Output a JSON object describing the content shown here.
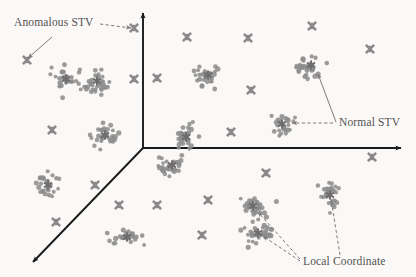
{
  "figure": {
    "title": "",
    "background_color": "#faf9f7",
    "axis_color": "#1a1a1a",
    "point_color": "#8e8d8d",
    "marker_color": "#8a8888",
    "center_color": "#6f6d6d",
    "label_color": "#555252",
    "annotation_line_color": "#7e7c7c"
  },
  "annotations": [
    {
      "id": "anomalous-stv",
      "label": "Anomalous STV",
      "x": 14,
      "y": 26,
      "anchor": "start"
    },
    {
      "id": "normal-stv",
      "label": "Normal STV",
      "x": 339,
      "y": 126,
      "anchor": "start"
    },
    {
      "id": "local-coordinate",
      "label": "Local Coordinate",
      "x": 303,
      "y": 265,
      "anchor": "start"
    }
  ],
  "chart_data": {
    "type": "scatter",
    "title": "",
    "xlabel": "",
    "ylabel": "",
    "grid": false,
    "legend": "none",
    "xlim": [
      0,
      416
    ],
    "ylim": [
      0,
      277
    ],
    "axes_3d": {
      "origin": [
        143,
        148
      ],
      "y_axis_end": [
        143,
        13
      ],
      "x_axis_end": [
        401,
        148
      ],
      "z_axis_end": [
        33,
        262
      ]
    },
    "series": [
      {
        "name": "Normal STV clusters",
        "marker": "dot",
        "color": "#8e8d8d",
        "clusters": [
          {
            "id": "c1",
            "center": [
              97,
              81
            ],
            "n": 34,
            "sx": 20,
            "sy": 13,
            "rot": -32
          },
          {
            "id": "c2",
            "center": [
              66,
              79
            ],
            "n": 26,
            "sx": 15,
            "sy": 14,
            "rot": -20
          },
          {
            "id": "c3",
            "center": [
              105,
              135
            ],
            "n": 30,
            "sx": 14,
            "sy": 12,
            "rot": 0
          },
          {
            "id": "c4",
            "center": [
              48,
              185
            ],
            "n": 26,
            "sx": 12,
            "sy": 13,
            "rot": 0
          },
          {
            "id": "c5",
            "center": [
              127,
              237
            ],
            "n": 26,
            "sx": 16,
            "sy": 8,
            "rot": 0
          },
          {
            "id": "c6",
            "center": [
              208,
              75
            ],
            "n": 28,
            "sx": 13,
            "sy": 12,
            "rot": 0
          },
          {
            "id": "c7",
            "center": [
              186,
              137
            ],
            "n": 30,
            "sx": 13,
            "sy": 12,
            "rot": 0
          },
          {
            "id": "c8",
            "center": [
              172,
              165
            ],
            "n": 34,
            "sx": 19,
            "sy": 11,
            "rot": 0
          },
          {
            "id": "c9",
            "center": [
              311,
              65
            ],
            "n": 32,
            "sx": 16,
            "sy": 13,
            "rot": 0
          },
          {
            "id": "c10",
            "center": [
              282,
              124
            ],
            "n": 26,
            "sx": 13,
            "sy": 12,
            "rot": 0
          },
          {
            "id": "c11",
            "center": [
              253,
              206
            ],
            "n": 32,
            "sx": 17,
            "sy": 11,
            "rot": 0
          },
          {
            "id": "c12",
            "center": [
              258,
              233
            ],
            "n": 34,
            "sx": 19,
            "sy": 12,
            "rot": 0
          },
          {
            "id": "c13",
            "center": [
              330,
              195
            ],
            "n": 30,
            "sx": 11,
            "sy": 17,
            "rot": 0
          }
        ]
      },
      {
        "name": "Anomalous STV",
        "marker": "cross",
        "color": "#8a8888",
        "points": [
          [
            27,
            60
          ],
          [
            134,
            28
          ],
          [
            187,
            37
          ],
          [
            248,
            38
          ],
          [
            312,
            26
          ],
          [
            370,
            49
          ],
          [
            134,
            79
          ],
          [
            157,
            78
          ],
          [
            251,
            90
          ],
          [
            52,
            130
          ],
          [
            231,
            132
          ],
          [
            95,
            185
          ],
          [
            266,
            173
          ],
          [
            119,
            205
          ],
          [
            157,
            205
          ],
          [
            208,
            200
          ],
          [
            56,
            222
          ],
          [
            202,
            235
          ],
          [
            372,
            157
          ]
        ]
      },
      {
        "name": "Local Coordinate centers",
        "marker": "star",
        "color": "#6f6d6d",
        "points": [
          [
            97,
            81
          ],
          [
            66,
            79
          ],
          [
            105,
            135
          ],
          [
            48,
            185
          ],
          [
            127,
            237
          ],
          [
            208,
            75
          ],
          [
            186,
            137
          ],
          [
            172,
            165
          ],
          [
            311,
            65
          ],
          [
            282,
            124
          ],
          [
            253,
            206
          ],
          [
            258,
            233
          ],
          [
            330,
            195
          ]
        ]
      }
    ],
    "annotation_arrows": [
      {
        "id": "anomalous-arrow-solid",
        "from": [
          52,
          37
        ],
        "to": [
          28,
          58
        ],
        "style": "solid"
      },
      {
        "id": "anomalous-arrow-dashed",
        "from": [
          100,
          24
        ],
        "to": [
          131,
          28
        ],
        "style": "dashed"
      },
      {
        "id": "normal-arrow-solid",
        "from": [
          336,
          122
        ],
        "to": [
          318,
          74
        ],
        "style": "solid"
      },
      {
        "id": "normal-arrow-dashed",
        "from": [
          333,
          123
        ],
        "to": [
          292,
          123
        ],
        "style": "dashed"
      },
      {
        "id": "local-arrow-1",
        "from": [
          300,
          259
        ],
        "to": [
          258,
          212
        ],
        "style": "dashed"
      },
      {
        "id": "local-arrow-2",
        "from": [
          300,
          261
        ],
        "to": [
          263,
          236
        ],
        "style": "dashed"
      },
      {
        "id": "local-arrow-3",
        "from": [
          340,
          255
        ],
        "to": [
          331,
          199
        ],
        "style": "dashed"
      }
    ]
  }
}
